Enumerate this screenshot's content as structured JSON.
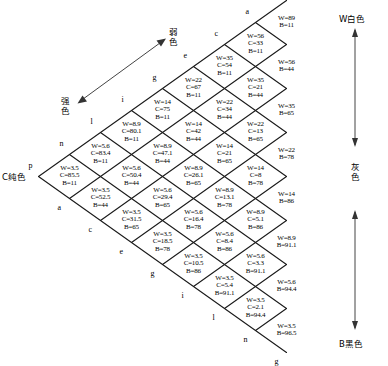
{
  "meta": {
    "line_color": "#1a1a1a",
    "text_color": "#000000",
    "background": "#ffffff"
  },
  "axes": {
    "right_axis": {
      "top_label": "W白色",
      "middle_label": "灰色",
      "bottom_label": "B黑色"
    },
    "diagonal_axis": {
      "upper_label": "弱色",
      "lower_label": "强色"
    },
    "apex_label": "C纯色"
  },
  "edge_letters": {
    "upper_left": [
      "p",
      "n",
      "l",
      "i",
      "g",
      "e",
      "c",
      "a"
    ],
    "lower_left": [
      "a",
      "c",
      "e",
      "g",
      "i",
      "l",
      "n",
      "g"
    ]
  },
  "chart_data": {
    "type": "table",
    "columns": [
      "W",
      "C",
      "B"
    ],
    "note": "Rightmost achromatic column has only W and B.",
    "rows": [
      {
        "id": "r1c8",
        "W": "W=89",
        "C": "",
        "B": "B=11"
      },
      {
        "id": "r1c7",
        "W": "W=56",
        "C": "C=33",
        "B": "B=11"
      },
      {
        "id": "r1c6",
        "W": "W=35",
        "C": "C=54",
        "B": "B=11"
      },
      {
        "id": "r1c5",
        "W": "W=22",
        "C": "C=67",
        "B": "B=11"
      },
      {
        "id": "r1c4",
        "W": "W=14",
        "C": "C=75",
        "B": "B=11"
      },
      {
        "id": "r1c3",
        "W": "W=8.9",
        "C": "C=80.1",
        "B": "B=11"
      },
      {
        "id": "r1c2",
        "W": "W=5.6",
        "C": "C=83.4",
        "B": "B=11"
      },
      {
        "id": "r1c1",
        "W": "W=3.5",
        "C": "C=85.5",
        "B": "B=11"
      },
      {
        "id": "r2c8",
        "W": "W=56",
        "C": "",
        "B": "B=44"
      },
      {
        "id": "r2c7",
        "W": "W=35",
        "C": "C=21",
        "B": "B=44"
      },
      {
        "id": "r2c6",
        "W": "W=22",
        "C": "C=34",
        "B": "B=44"
      },
      {
        "id": "r2c5",
        "W": "W=14",
        "C": "C=42",
        "B": "B=44"
      },
      {
        "id": "r2c4",
        "W": "W=8.9",
        "C": "C=47.1",
        "B": "B=44"
      },
      {
        "id": "r2c3",
        "W": "W=5.6",
        "C": "C=50.4",
        "B": "B=44"
      },
      {
        "id": "r2c2",
        "W": "W=3.5",
        "C": "C=52.5",
        "B": "B=44"
      },
      {
        "id": "r3c8",
        "W": "W=35",
        "C": "",
        "B": "B=65"
      },
      {
        "id": "r3c7",
        "W": "W=22",
        "C": "C=13",
        "B": "B=65"
      },
      {
        "id": "r3c6",
        "W": "W=14",
        "C": "C=21",
        "B": "B=65"
      },
      {
        "id": "r3c5",
        "W": "W=8.9",
        "C": "C=26.1",
        "B": "B=65"
      },
      {
        "id": "r3c4",
        "W": "W=5.6",
        "C": "C=29.4",
        "B": "B=65"
      },
      {
        "id": "r3c3",
        "W": "W=3.5",
        "C": "C=31.5",
        "B": "B=65"
      },
      {
        "id": "r4c8",
        "W": "W=22",
        "C": "",
        "B": "B=78"
      },
      {
        "id": "r4c7",
        "W": "W=14",
        "C": "C=8",
        "B": "B=78"
      },
      {
        "id": "r4c6",
        "W": "W=8.9",
        "C": "C=13.1",
        "B": "B=78"
      },
      {
        "id": "r4c5",
        "W": "W=5.6",
        "C": "C=16.4",
        "B": "B=78"
      },
      {
        "id": "r4c4",
        "W": "W=3.5",
        "C": "C=18.5",
        "B": "B=78"
      },
      {
        "id": "r5c8",
        "W": "W=14",
        "C": "",
        "B": "B=86"
      },
      {
        "id": "r5c7",
        "W": "W=8.9",
        "C": "C=5.1",
        "B": "B=86"
      },
      {
        "id": "r5c6",
        "W": "W=5.6",
        "C": "C=8.4",
        "B": "B=86"
      },
      {
        "id": "r5c5",
        "W": "W=3.5",
        "C": "C=10.5",
        "B": "B=86"
      },
      {
        "id": "r6c8",
        "W": "W=8.9",
        "C": "",
        "B": "B=91.1"
      },
      {
        "id": "r6c7",
        "W": "W=5.6",
        "C": "C=3.3",
        "B": "B=91.1"
      },
      {
        "id": "r6c6",
        "W": "W=3.5",
        "C": "C=5.4",
        "B": "B=91.1"
      },
      {
        "id": "r7c8",
        "W": "W=5.6",
        "C": "",
        "B": "B=94.4"
      },
      {
        "id": "r7c7",
        "W": "W=3.5",
        "C": "C=2.1",
        "B": "B=94.4"
      },
      {
        "id": "r8c8",
        "W": "W=3.5",
        "C": "",
        "B": "B=96.5"
      }
    ]
  }
}
